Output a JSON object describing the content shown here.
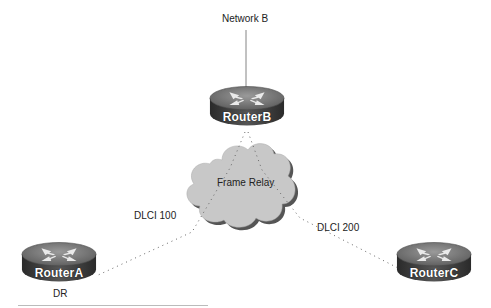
{
  "diagram": {
    "network_label": "Network B",
    "cloud_label": "Frame Relay",
    "routers": [
      {
        "id": "routerB",
        "name": "RouterB"
      },
      {
        "id": "routerA",
        "name": "RouterA",
        "role": "DR"
      },
      {
        "id": "routerC",
        "name": "RouterC"
      }
    ],
    "links": [
      {
        "from": "RouterA",
        "to": "RouterB",
        "label": "DLCI 100",
        "style": "dotted"
      },
      {
        "from": "RouterC",
        "to": "RouterB",
        "label": "DLCI 200",
        "style": "dotted"
      },
      {
        "from": "RouterB",
        "to": "Network B",
        "style": "solid"
      }
    ],
    "colors": {
      "router_top": "#7a7a7a",
      "router_side": "#3a3a3a",
      "cloud_fill": "#c8c8c8",
      "cloud_shadow": "#555555",
      "link": "#666666"
    }
  }
}
